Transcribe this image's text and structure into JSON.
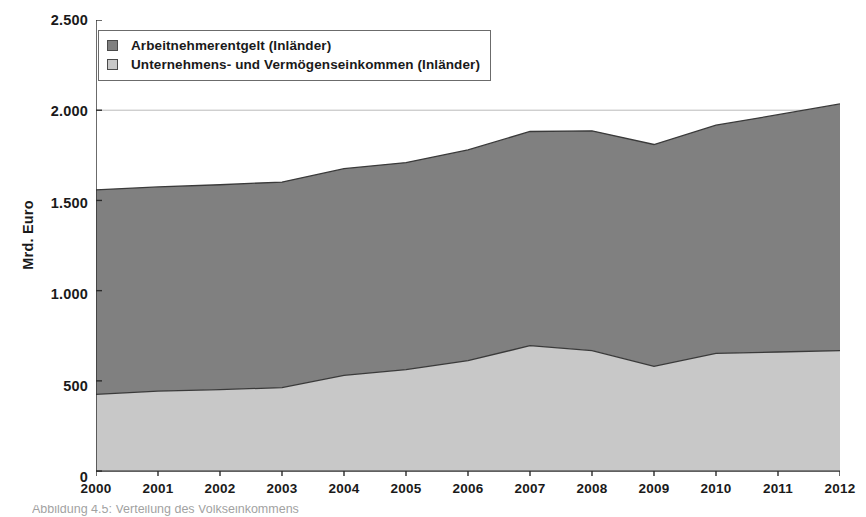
{
  "chart_data": {
    "type": "area",
    "stacked": true,
    "title": "",
    "xlabel": "",
    "ylabel": "Mrd. Euro",
    "categories": [
      "2000",
      "2001",
      "2002",
      "2003",
      "2004",
      "2005",
      "2006",
      "2007",
      "2008",
      "2009",
      "2010",
      "2011",
      "2012"
    ],
    "x": [
      2000,
      2001,
      2002,
      2003,
      2004,
      2005,
      2006,
      2007,
      2008,
      2009,
      2010,
      2011,
      2012
    ],
    "series": [
      {
        "name": "Unternehmens- und Vermögenseinkommen (Inländer)",
        "color": "#c8c8c8",
        "values": [
          425,
          443,
          452,
          462,
          530,
          562,
          612,
          695,
          668,
          580,
          652,
          660,
          667
        ]
      },
      {
        "name": "Arbeitnehmerentgelt (Inländer)",
        "color": "#808080",
        "values": [
          1134,
          1132,
          1135,
          1140,
          1146,
          1148,
          1168,
          1187,
          1218,
          1230,
          1265,
          1315,
          1368
        ]
      }
    ],
    "totals": [
      1559,
      1575,
      1587,
      1602,
      1676,
      1710,
      1780,
      1882,
      1886,
      1810,
      1917,
      1975,
      2035
    ],
    "ylim": [
      0,
      2500
    ],
    "yticks": [
      0,
      500,
      1000,
      1500,
      2000,
      2500
    ],
    "ytick_labels": [
      "0",
      "500",
      "1.000",
      "1.500",
      "2.000",
      "2.500"
    ],
    "xlim": [
      2000,
      2012
    ],
    "grid": "horizontal-at-2000-only",
    "legend_position": "top-left"
  },
  "legend": {
    "items": [
      {
        "label": "Arbeitnehmerentgelt (Inländer)",
        "color": "#808080"
      },
      {
        "label": "Unternehmens- und Vermögenseinkommen (Inländer)",
        "color": "#c8c8c8"
      }
    ]
  },
  "axis": {
    "y_title": "Mrd. Euro"
  },
  "caption": {
    "text": "Abbildung 4.5: Verteilung des Volkseinkommens"
  }
}
